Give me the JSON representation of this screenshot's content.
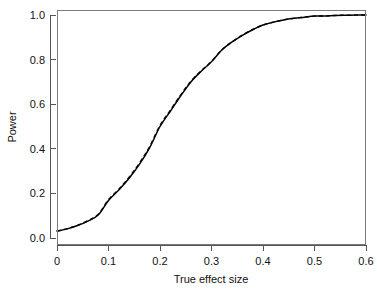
{
  "top_fragment": {
    "text": "",
    "visible": false
  },
  "chart_data": {
    "type": "line",
    "title": "",
    "subtitle": "",
    "xlabel": "True effect size",
    "ylabel": "Power",
    "xlim": [
      0,
      0.6
    ],
    "ylim": [
      0,
      1.0
    ],
    "xticks": [
      0,
      0.1,
      0.2,
      0.3,
      0.4,
      0.5,
      0.6
    ],
    "xtick_labels": [
      "0",
      "0.1",
      "0.2",
      "0.3",
      "0.4",
      "0.5",
      "0.6"
    ],
    "yticks": [
      0.0,
      0.2,
      0.4,
      0.6,
      0.8,
      1.0
    ],
    "ytick_labels": [
      "0.0",
      "0.2",
      "0.4",
      "0.6",
      "0.8",
      "1.0"
    ],
    "grid": false,
    "legend": false,
    "legend_position": "none",
    "frame": "box",
    "tick_direction": "out",
    "colors": {
      "curve_solid": "#000000",
      "curve_dashed": "#111111",
      "frame": "#7a7a7a",
      "axis": "#555555",
      "background": "#ffffff"
    },
    "x": [
      0,
      0.02,
      0.04,
      0.06,
      0.08,
      0.1,
      0.12,
      0.14,
      0.16,
      0.18,
      0.2,
      0.22,
      0.24,
      0.26,
      0.28,
      0.3,
      0.32,
      0.34,
      0.36,
      0.38,
      0.4,
      0.42,
      0.44,
      0.46,
      0.48,
      0.5,
      0.52,
      0.54,
      0.56,
      0.58,
      0.6
    ],
    "series": [
      {
        "name": "theoretical power",
        "style": "solid",
        "values": [
          0.031,
          0.041,
          0.056,
          0.076,
          0.103,
          0.168,
          0.215,
          0.268,
          0.33,
          0.405,
          0.5,
          0.568,
          0.637,
          0.7,
          0.748,
          0.79,
          0.843,
          0.879,
          0.909,
          0.934,
          0.955,
          0.968,
          0.978,
          0.985,
          0.99,
          0.995,
          0.996,
          0.998,
          0.999,
          0.9995,
          1.0
        ]
      },
      {
        "name": "simulated power",
        "style": "dashed",
        "values": [
          0.031,
          0.042,
          0.057,
          0.078,
          0.106,
          0.172,
          0.219,
          0.273,
          0.336,
          0.411,
          0.505,
          0.573,
          0.641,
          0.703,
          0.75,
          0.792,
          0.844,
          0.88,
          0.91,
          0.935,
          0.955,
          0.968,
          0.978,
          0.985,
          0.99,
          0.995,
          0.996,
          0.998,
          0.999,
          0.9995,
          1.0
        ]
      }
    ]
  }
}
